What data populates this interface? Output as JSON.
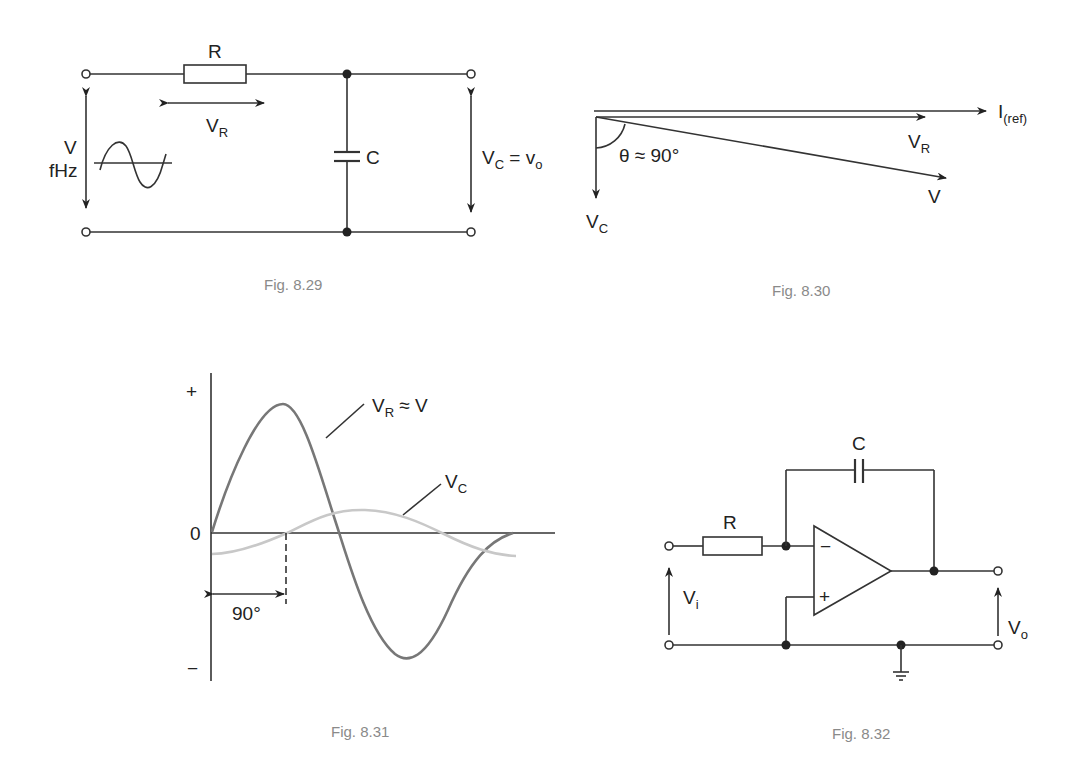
{
  "figures": [
    {
      "id": "fig-8-29",
      "caption": "Fig. 8.29",
      "type": "circuit",
      "labels": {
        "resistor": "R",
        "resistor_voltage": "V",
        "resistor_voltage_sub": "R",
        "source_voltage": "V",
        "source_freq": "fHz",
        "capacitor": "C",
        "output_main": "V",
        "output_sub": "C",
        "output_eq": " = v",
        "output_eq_sub": "o"
      }
    },
    {
      "id": "fig-8-30",
      "caption": "Fig. 8.30",
      "type": "phasor",
      "labels": {
        "ref_main": "I",
        "ref_sub": "(ref)",
        "vr_main": "V",
        "vr_sub": "R",
        "v": "V",
        "vc_main": "V",
        "vc_sub": "C",
        "angle": "θ ≈ 90°"
      }
    },
    {
      "id": "fig-8-31",
      "caption": "Fig. 8.31",
      "type": "waveform",
      "labels": {
        "plus": "+",
        "zero": "0",
        "minus": "−",
        "vr_main": "V",
        "vr_sub": "R",
        "vr_tail": " ≈ V",
        "vc_main": "V",
        "vc_sub": "C",
        "phase": "90°"
      },
      "colors": {
        "vr": "#777777",
        "vc": "#c8c8c8"
      }
    },
    {
      "id": "fig-8-32",
      "caption": "Fig. 8.32",
      "type": "circuit",
      "labels": {
        "capacitor": "C",
        "resistor": "R",
        "minus": "−",
        "plus": "+",
        "vi_main": "V",
        "vi_sub": "i",
        "vo_main": "V",
        "vo_sub": "o"
      }
    }
  ]
}
